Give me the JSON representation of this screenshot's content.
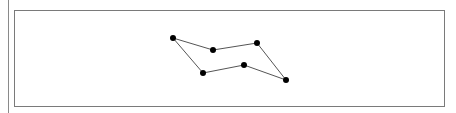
{
  "diagram": {
    "type": "closed-polygon",
    "points": [
      {
        "x": 173,
        "y": 38
      },
      {
        "x": 213,
        "y": 50
      },
      {
        "x": 257,
        "y": 43
      },
      {
        "x": 286,
        "y": 80
      },
      {
        "x": 244,
        "y": 65
      },
      {
        "x": 203,
        "y": 73
      }
    ],
    "line_color": "#555555",
    "dot_color": "#000000"
  }
}
